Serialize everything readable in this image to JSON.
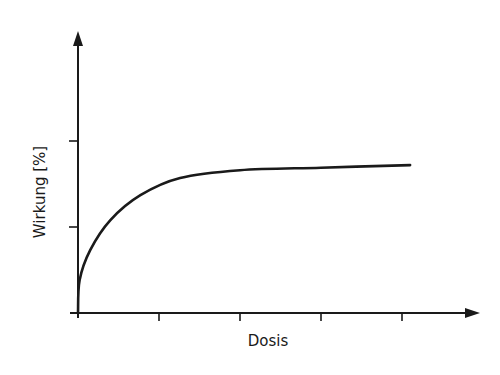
{
  "chart_data": {
    "type": "line",
    "title": "",
    "xlabel": "Dosis",
    "ylabel": "Wirkung [%]",
    "x_ticks": 4,
    "y_ticks": 2,
    "grid": false,
    "legend": null,
    "axis_arrows": true,
    "xlim": [
      0,
      5
    ],
    "ylim": [
      0,
      3
    ],
    "series": [
      {
        "name": "Dosis-Wirkungs-Kurve",
        "color": "#1a1a1a",
        "x": [
          0,
          0.02,
          0.15,
          0.4,
          0.77,
          1.26,
          2.0,
          3.0,
          4.1
        ],
        "y": [
          0,
          0.38,
          0.73,
          1.08,
          1.37,
          1.57,
          1.66,
          1.69,
          1.72
        ]
      }
    ]
  },
  "colors": {
    "line": "#1a1a1a",
    "axis": "#1a1a1a",
    "background": "#ffffff"
  }
}
